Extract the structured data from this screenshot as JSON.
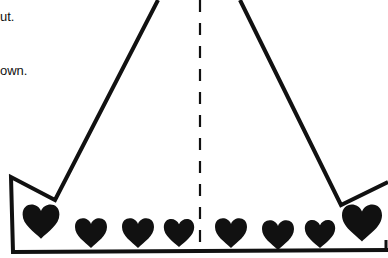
{
  "instructions": {
    "line1_fragment": "ut.",
    "line2_fragment": "own."
  },
  "template": {
    "shape": "crown-cutout",
    "fold_line": "dashed-center",
    "heart_count": 8,
    "ink_color": "#111111",
    "paper_color": "#ffffff"
  }
}
